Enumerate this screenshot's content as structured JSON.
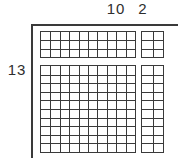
{
  "diagram": {
    "type": "area-model-base-ten-blocks",
    "labels": {
      "top_tens": "10",
      "top_ones": "2",
      "left_rows": "13"
    },
    "grids": {
      "top_left": {
        "cols": 10,
        "rows": 3
      },
      "top_right": {
        "cols": 2,
        "rows": 3
      },
      "bottom_left": {
        "cols": 10,
        "rows": 10
      },
      "bottom_right": {
        "cols": 2,
        "rows": 10
      }
    },
    "colors": {
      "line": "#3a3a3a",
      "text": "#2e2e2e",
      "background": "#ffffff"
    }
  }
}
